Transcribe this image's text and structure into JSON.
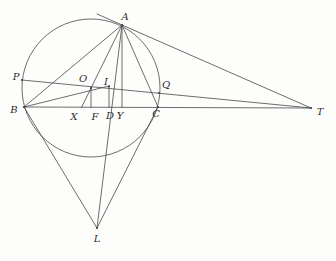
{
  "figure": {
    "type": "geometry-diagram",
    "canvas": {
      "width": 336,
      "height": 261,
      "background": "#fdfdfc"
    },
    "style": {
      "stroke_color": "#474747",
      "stroke_width": 0.8,
      "dot_radius": 1.1,
      "label_color": "#2e2e2e",
      "label_font_size": 10
    },
    "circle": {
      "name": "circumcircle",
      "cx": 91,
      "cy": 88,
      "r": 69
    },
    "points": [
      {
        "id": "A",
        "label": "A",
        "x": 122,
        "y": 25,
        "label_x": 125,
        "label_y": 20,
        "dot": true
      },
      {
        "id": "P",
        "label": "P",
        "x": 22,
        "y": 80,
        "label_x": 16,
        "label_y": 80,
        "dot": true
      },
      {
        "id": "O",
        "label": "O",
        "x": 91,
        "y": 88,
        "label_x": 83,
        "label_y": 82,
        "dot": true
      },
      {
        "id": "I",
        "label": "I",
        "x": 109,
        "y": 86.5,
        "label_x": 106,
        "label_y": 85,
        "dot": true
      },
      {
        "id": "Q",
        "label": "Q",
        "x": 159,
        "y": 93,
        "label_x": 166,
        "label_y": 88,
        "dot": true
      },
      {
        "id": "B",
        "label": "B",
        "x": 24,
        "y": 107,
        "label_x": 14,
        "label_y": 113,
        "dot": true
      },
      {
        "id": "X",
        "label": "X",
        "x": 81.5,
        "y": 107.5,
        "label_x": 74,
        "label_y": 120,
        "dot": false
      },
      {
        "id": "F",
        "label": "F",
        "x": 91,
        "y": 107.5,
        "label_x": 95,
        "label_y": 120,
        "dot": false
      },
      {
        "id": "D",
        "label": "D",
        "x": 109,
        "y": 107.5,
        "label_x": 110,
        "label_y": 119,
        "dot": false
      },
      {
        "id": "Y",
        "label": "Y",
        "x": 122,
        "y": 107.5,
        "label_x": 120,
        "label_y": 119,
        "dot": false
      },
      {
        "id": "C",
        "label": "C",
        "x": 158,
        "y": 107,
        "label_x": 156,
        "label_y": 117,
        "dot": true
      },
      {
        "id": "T",
        "label": "T",
        "x": 311,
        "y": 108,
        "label_x": 320,
        "label_y": 115,
        "dot": true
      },
      {
        "id": "L",
        "label": "L",
        "x": 97,
        "y": 228,
        "label_x": 97,
        "label_y": 242,
        "dot": true
      }
    ],
    "segments": [
      {
        "name": "line-B-C-T",
        "x1": 24,
        "y1": 107,
        "x2": 311,
        "y2": 108
      },
      {
        "name": "line-P-Q-T",
        "x1": 22,
        "y1": 80,
        "x2": 311,
        "y2": 108
      },
      {
        "name": "tangent-at-A-to-T",
        "x1": 97,
        "y1": 14,
        "x2": 311,
        "y2": 108
      },
      {
        "name": "segment-A-B",
        "x1": 122,
        "y1": 25,
        "x2": 24,
        "y2": 107
      },
      {
        "name": "segment-A-C",
        "x1": 122,
        "y1": 25,
        "x2": 158,
        "y2": 107
      },
      {
        "name": "segment-A-O-X",
        "x1": 122,
        "y1": 25,
        "x2": 81.5,
        "y2": 107.5
      },
      {
        "name": "segment-O-F",
        "x1": 91,
        "y1": 88,
        "x2": 91,
        "y2": 107.5
      },
      {
        "name": "segment-A-Y",
        "x1": 122,
        "y1": 25,
        "x2": 122,
        "y2": 107.5
      },
      {
        "name": "segment-A-D-L",
        "x1": 122,
        "y1": 25,
        "x2": 97,
        "y2": 228
      },
      {
        "name": "segment-B-L",
        "x1": 24,
        "y1": 107,
        "x2": 97,
        "y2": 228
      },
      {
        "name": "segment-C-L",
        "x1": 158,
        "y1": 107,
        "x2": 97,
        "y2": 228
      },
      {
        "name": "segment-B-I",
        "x1": 24,
        "y1": 107,
        "x2": 109,
        "y2": 86
      },
      {
        "name": "segment-I-D",
        "x1": 109,
        "y1": 85.5,
        "x2": 109,
        "y2": 107.5
      }
    ]
  }
}
